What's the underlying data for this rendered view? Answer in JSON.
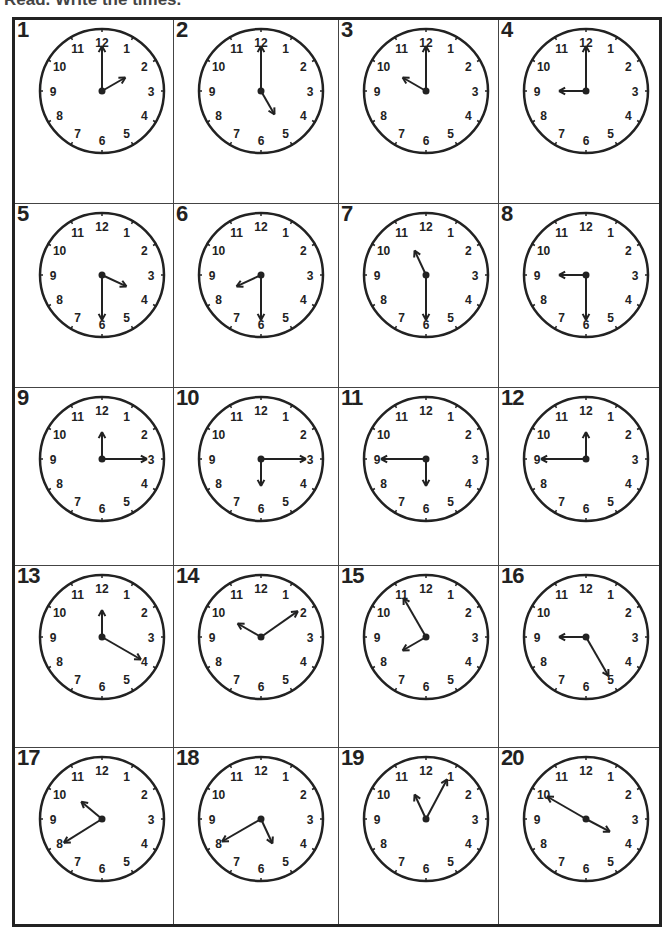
{
  "worksheet": {
    "instruction": "Read. Write the times.",
    "clock_numerals": [
      "12",
      "1",
      "2",
      "3",
      "4",
      "5",
      "6",
      "7",
      "8",
      "9",
      "10",
      "11"
    ],
    "clocks": [
      {
        "label": "1",
        "hour": 2,
        "minute": 0
      },
      {
        "label": "2",
        "hour": 5,
        "minute": 0
      },
      {
        "label": "3",
        "hour": 10,
        "minute": 0
      },
      {
        "label": "4",
        "hour": 9,
        "minute": 0
      },
      {
        "label": "5",
        "hour": 3,
        "minute": 30
      },
      {
        "label": "6",
        "hour": 8,
        "minute": 30
      },
      {
        "label": "7",
        "hour": 11,
        "minute": 30
      },
      {
        "label": "8",
        "hour": 9,
        "minute": 30
      },
      {
        "label": "9",
        "hour": 12,
        "minute": 15
      },
      {
        "label": "10",
        "hour": 6,
        "minute": 15
      },
      {
        "label": "11",
        "hour": 6,
        "minute": 45
      },
      {
        "label": "12",
        "hour": 12,
        "minute": 45
      },
      {
        "label": "13",
        "hour": 12,
        "minute": 20
      },
      {
        "label": "14",
        "hour": 10,
        "minute": 10
      },
      {
        "label": "15",
        "hour": 7,
        "minute": 55
      },
      {
        "label": "16",
        "hour": 9,
        "minute": 25
      },
      {
        "label": "17",
        "hour": 10,
        "minute": 40
      },
      {
        "label": "18",
        "hour": 4,
        "minute": 40
      },
      {
        "label": "19",
        "hour": 11,
        "minute": 5
      },
      {
        "label": "20",
        "hour": 3,
        "minute": 50
      }
    ],
    "hand_angles_drawn": [
      {
        "label": "1",
        "hour_deg": 60,
        "minute_deg": 0
      },
      {
        "label": "2",
        "hour_deg": 150,
        "minute_deg": 0
      },
      {
        "label": "3",
        "hour_deg": 300,
        "minute_deg": 0
      },
      {
        "label": "4",
        "hour_deg": 270,
        "minute_deg": 0
      },
      {
        "label": "5",
        "hour_deg": 115,
        "minute_deg": 180
      },
      {
        "label": "6",
        "hour_deg": 245,
        "minute_deg": 180
      },
      {
        "label": "7",
        "hour_deg": 335,
        "minute_deg": 180
      },
      {
        "label": "8",
        "hour_deg": 270,
        "minute_deg": 180
      },
      {
        "label": "9",
        "hour_deg": 0,
        "minute_deg": 90
      },
      {
        "label": "10",
        "hour_deg": 180,
        "minute_deg": 90
      },
      {
        "label": "11",
        "hour_deg": 180,
        "minute_deg": 270
      },
      {
        "label": "12",
        "hour_deg": 0,
        "minute_deg": 270
      },
      {
        "label": "13",
        "hour_deg": 0,
        "minute_deg": 120
      },
      {
        "label": "14",
        "hour_deg": 300,
        "minute_deg": 55
      },
      {
        "label": "15",
        "hour_deg": 240,
        "minute_deg": 330
      },
      {
        "label": "16",
        "hour_deg": 270,
        "minute_deg": 150
      },
      {
        "label": "17",
        "hour_deg": 310,
        "minute_deg": 238
      },
      {
        "label": "18",
        "hour_deg": 155,
        "minute_deg": 240
      },
      {
        "label": "19",
        "hour_deg": 335,
        "minute_deg": 28
      },
      {
        "label": "20",
        "hour_deg": 118,
        "minute_deg": 300
      }
    ]
  },
  "colors": {
    "ink": "#222222",
    "paper": "#ffffff"
  }
}
